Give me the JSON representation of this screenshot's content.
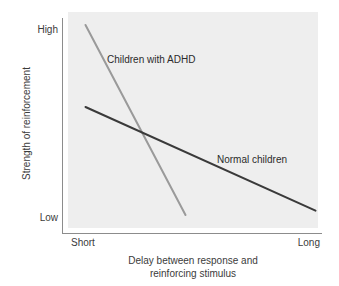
{
  "chart_data": {
    "type": "line",
    "title": "",
    "subtitle": "",
    "xlabel_line1": "Delay between response and",
    "xlabel_line2": "reinforcing stimulus",
    "ylabel": "Strength of reinforcement",
    "x_tick_labels": [
      "Short",
      "Long"
    ],
    "y_tick_labels": [
      "High",
      "Low"
    ],
    "xlim": [
      "Short",
      "Long"
    ],
    "ylim": [
      "Low",
      "High"
    ],
    "grid": false,
    "legend_position": "inline-annotations",
    "plot_background": "#eeeeee",
    "axis_color": "#8c8c8c",
    "series": [
      {
        "name": "Children with ADHD",
        "color": "#9a9a9a",
        "width": 2,
        "points": [
          {
            "x": 0.07,
            "y": 0.94
          },
          {
            "x": 0.47,
            "y": 0.06
          }
        ],
        "label_x": 107,
        "label_y": 54
      },
      {
        "name": "Normal children",
        "color": "#3a3a3a",
        "width": 2,
        "points": [
          {
            "x": 0.07,
            "y": 0.56
          },
          {
            "x": 0.99,
            "y": 0.08
          }
        ],
        "label_x": 217,
        "label_y": 154
      }
    ],
    "annotations": [
      {
        "text": "Children with ADHD"
      },
      {
        "text": "Normal children"
      }
    ]
  },
  "axes": {
    "y_high": "High",
    "y_low": "Low",
    "x_short": "Short",
    "x_long": "Long",
    "y_title": "Strength of reinforcement",
    "x_title_line1": "Delay between response and",
    "x_title_line2": "reinforcing stimulus"
  },
  "series_labels": {
    "adhd": "Children with ADHD",
    "normal": "Normal children"
  }
}
